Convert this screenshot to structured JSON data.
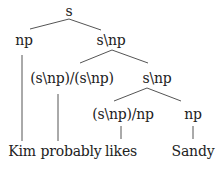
{
  "diagram": {
    "type": "ccg-parse-tree",
    "line_color": "#555555",
    "text_color": "#222222",
    "nodes": {
      "root": {
        "label": "s"
      },
      "subject": {
        "label": "np"
      },
      "vp": {
        "label": "s\\np"
      },
      "adverb_cat": {
        "label": "(s\\np)/(s\\np)"
      },
      "vp_inner": {
        "label": "s\\np"
      },
      "verb_cat": {
        "label": "(s\\np)/np"
      },
      "object": {
        "label": "np"
      }
    },
    "leaves": {
      "kim": {
        "label": "Kim"
      },
      "probably": {
        "label": "probably"
      },
      "likes": {
        "label": "likes"
      },
      "sandy": {
        "label": "Sandy"
      }
    },
    "edges": [
      [
        "s",
        "np"
      ],
      [
        "s",
        "s\\np"
      ],
      [
        "s\\np",
        "(s\\np)/(s\\np)"
      ],
      [
        "s\\np",
        "s\\np"
      ],
      [
        "s\\np",
        "(s\\np)/np"
      ],
      [
        "s\\np",
        "np"
      ],
      [
        "np",
        "Kim"
      ],
      [
        "(s\\np)/(s\\np)",
        "probably"
      ],
      [
        "(s\\np)/np",
        "likes"
      ],
      [
        "np",
        "Sandy"
      ]
    ]
  }
}
